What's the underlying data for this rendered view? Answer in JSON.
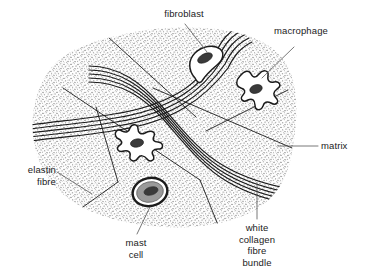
{
  "diagram": {
    "type": "labelled-biological-diagram",
    "background_color": "#ffffff",
    "ink_color": "#1b1b1b",
    "matrix_stipple_color": "#6e6e6e",
    "mast_cell_cytoplasm_color": "#9a9a9a",
    "nucleus_color": "#3a3a3a"
  },
  "labels": {
    "fibroblast": "fibroblast",
    "macrophage": "macrophage",
    "matrix": "matrix",
    "elastin_fibre": "elastin\nfibre",
    "mast_cell": "mast\ncell",
    "white_collagen_fibre_bundle": "white\ncollagen\nfibre\nbundle"
  },
  "structures": [
    {
      "name": "matrix",
      "label": "matrix",
      "count": 1
    },
    {
      "name": "white-collagen-fibre-bundle",
      "label": "white collagen fibre bundle",
      "count": 2
    },
    {
      "name": "elastin-fibre",
      "label": "elastin fibre",
      "count": 7
    },
    {
      "name": "fibroblast",
      "label": "fibroblast",
      "count": 1
    },
    {
      "name": "macrophage",
      "label": "macrophage",
      "count": 2
    },
    {
      "name": "mast-cell",
      "label": "mast cell",
      "count": 1
    }
  ]
}
